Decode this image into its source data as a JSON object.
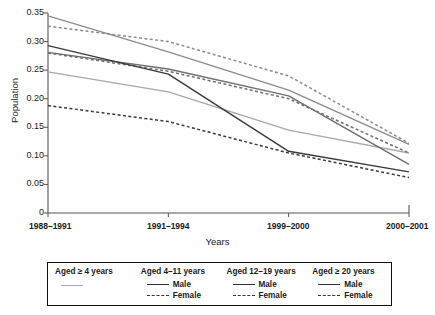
{
  "chart_data": {
    "type": "line",
    "title": "",
    "xlabel": "Years",
    "ylabel": "Population",
    "categories": [
      "1988–1991",
      "1991–1994",
      "1999–2000",
      "2000–2001"
    ],
    "ylim": [
      0,
      0.35
    ],
    "yticks": [
      0,
      0.05,
      0.1,
      0.15,
      0.2,
      0.25,
      0.3,
      0.35
    ],
    "ytick_labels": [
      "0",
      "0.05",
      "0.10",
      "0.15",
      "0.20",
      "0.25",
      "0.30",
      "0.35"
    ],
    "grid": false,
    "legend_position": "below",
    "series": [
      {
        "name": "Aged ≥ 4 years",
        "group": "Aged ≥ 4 years",
        "sex": "",
        "style": "solid",
        "color": "#a9a9a9",
        "values": [
          0.247,
          0.212,
          0.145,
          0.105
        ]
      },
      {
        "name": "Aged 4–11 years Male",
        "group": "Aged 4–11 years",
        "sex": "Male",
        "style": "solid",
        "color": "#8c8c8c",
        "values": [
          0.345,
          0.282,
          0.215,
          0.12
        ]
      },
      {
        "name": "Aged 4–11 years Female",
        "group": "Aged 4–11 years",
        "sex": "Female",
        "style": "dashed",
        "color": "#8c8c8c",
        "values": [
          0.327,
          0.3,
          0.24,
          0.122
        ]
      },
      {
        "name": "Aged 12–19 years Male",
        "group": "Aged 12–19 years",
        "sex": "Male",
        "style": "solid",
        "color": "#6e6e6e",
        "values": [
          0.281,
          0.252,
          0.205,
          0.085
        ]
      },
      {
        "name": "Aged 12–19 years Female",
        "group": "Aged 12–19 years",
        "sex": "Female",
        "style": "dashed",
        "color": "#6e6e6e",
        "values": [
          0.28,
          0.248,
          0.2,
          0.105
        ]
      },
      {
        "name": "Aged ≥ 20 years Male",
        "group": "Aged ≥ 20 years",
        "sex": "Male",
        "style": "solid",
        "color": "#3a3a3a",
        "values": [
          0.293,
          0.243,
          0.108,
          0.072
        ]
      },
      {
        "name": "Aged ≥ 20 years Female",
        "group": "Aged ≥ 20 years",
        "sex": "Female",
        "style": "dashed",
        "color": "#3a3a3a",
        "values": [
          0.188,
          0.16,
          0.105,
          0.062
        ]
      }
    ]
  },
  "axis": {
    "y_title": "Population",
    "x_title": "Years"
  },
  "legend": {
    "groups": [
      {
        "title": "Aged ≥ 4 years",
        "entries": [
          {
            "label": "",
            "style": "solid-light"
          }
        ]
      },
      {
        "title": "Aged 4–11 years",
        "entries": [
          {
            "label": "Male",
            "style": "solid"
          },
          {
            "label": "Female",
            "style": "dashed"
          }
        ]
      },
      {
        "title": "Aged 12–19 years",
        "entries": [
          {
            "label": "Male",
            "style": "solid"
          },
          {
            "label": "Female",
            "style": "dashed"
          }
        ]
      },
      {
        "title": "Aged ≥ 20 years",
        "entries": [
          {
            "label": "Male",
            "style": "solid"
          },
          {
            "label": "Female",
            "style": "dashed"
          }
        ]
      }
    ]
  },
  "colors": {
    "axis": "#555555",
    "text": "#1a1a1a",
    "legend_border": "#111111"
  }
}
